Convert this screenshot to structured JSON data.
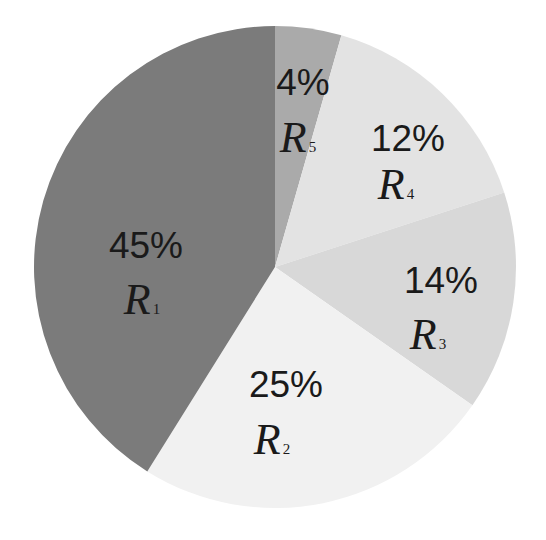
{
  "chart_data": {
    "type": "pie",
    "title": "",
    "categories": [
      "R1",
      "R2",
      "R3",
      "R4",
      "R5"
    ],
    "values": [
      45,
      25,
      14,
      12,
      4
    ],
    "unit": "%",
    "labels": [
      {
        "name": "R",
        "sub": "1",
        "pct": "45%"
      },
      {
        "name": "R",
        "sub": "2",
        "pct": "25%"
      },
      {
        "name": "R",
        "sub": "3",
        "pct": "14%"
      },
      {
        "name": "R",
        "sub": "4",
        "pct": "12%"
      },
      {
        "name": "R",
        "sub": "5",
        "pct": "4%"
      }
    ],
    "colors": [
      "#7b7b7b",
      "#f1f1f1",
      "#d8d8d8",
      "#e3e3e3",
      "#aaaaaa"
    ],
    "legend": "none",
    "start_angle_deg": 0,
    "direction": "clockwise-from-top: R5, R4, R3, R2, R1"
  },
  "slices_draw": [
    {
      "key": "R5",
      "start": 0,
      "end": 16,
      "color": "#aaaaaa"
    },
    {
      "key": "R4",
      "start": 16,
      "end": 72,
      "color": "#e3e3e3"
    },
    {
      "key": "R3",
      "start": 72,
      "end": 125,
      "color": "#d8d8d8"
    },
    {
      "key": "R2",
      "start": 125,
      "end": 212,
      "color": "#f1f1f1"
    },
    {
      "key": "R1",
      "start": 212,
      "end": 360,
      "color": "#7b7b7b"
    }
  ]
}
